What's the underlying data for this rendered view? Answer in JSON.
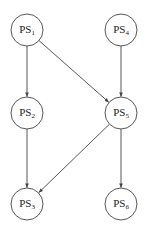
{
  "diagram": {
    "type": "directed-graph",
    "colors": {
      "stroke": "#444444",
      "text": "#222222",
      "background": "#ffffff"
    },
    "nodes": [
      {
        "id": "PS1",
        "base": "PS",
        "sub": "1",
        "cx": 27,
        "cy": 30
      },
      {
        "id": "PS4",
        "base": "PS",
        "sub": "4",
        "cx": 121,
        "cy": 30
      },
      {
        "id": "PS2",
        "base": "PS",
        "sub": "2",
        "cx": 27,
        "cy": 113
      },
      {
        "id": "PS5",
        "base": "PS",
        "sub": "5",
        "cx": 121,
        "cy": 113
      },
      {
        "id": "PS3",
        "base": "PS",
        "sub": "3",
        "cx": 27,
        "cy": 204
      },
      {
        "id": "PS6",
        "base": "PS",
        "sub": "6",
        "cx": 121,
        "cy": 204
      }
    ],
    "edges": [
      {
        "from": "PS1",
        "to": "PS2"
      },
      {
        "from": "PS1",
        "to": "PS5"
      },
      {
        "from": "PS4",
        "to": "PS5"
      },
      {
        "from": "PS2",
        "to": "PS3"
      },
      {
        "from": "PS5",
        "to": "PS3"
      },
      {
        "from": "PS5",
        "to": "PS6"
      }
    ]
  }
}
